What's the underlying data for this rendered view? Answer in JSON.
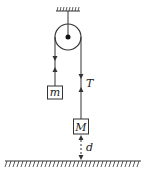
{
  "diagram": {
    "type": "pulley-system",
    "colors": {
      "stroke": "#333333",
      "background": "#ffffff"
    },
    "labels": {
      "small_mass": "m",
      "large_mass": "M",
      "tension": "T",
      "distance": "d"
    },
    "elements": {
      "ceiling": "ceiling-support",
      "pulley": "fixed-pulley",
      "ground": "ground-surface"
    }
  }
}
